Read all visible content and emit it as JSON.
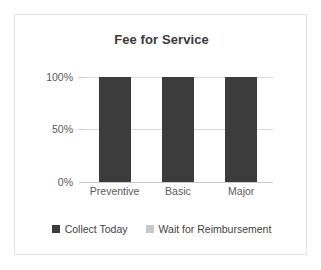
{
  "chart_data": {
    "type": "bar",
    "title": "Fee for Service",
    "xlabel": "",
    "ylabel": "",
    "categories": [
      "Preventive",
      "Basic",
      "Major"
    ],
    "series": [
      {
        "name": "Collect Today",
        "values": [
          100,
          100,
          100
        ],
        "color": "#3c3c3c"
      },
      {
        "name": "Wait for Reimbursement",
        "values": [
          0,
          0,
          0
        ],
        "color": "#c8c8c8"
      }
    ],
    "ylim": [
      0,
      100
    ],
    "yticks": [
      0,
      50,
      100
    ],
    "ytick_labels": [
      "0%",
      "50%",
      "100%"
    ],
    "grid": true,
    "legend_position": "bottom",
    "units": "percent"
  },
  "frame": {
    "border_color": "#e3e3e3",
    "background": "#ffffff"
  },
  "axis": {
    "labels": {
      "y100": "100%",
      "y50": "50%",
      "y0": "0%"
    },
    "categories": {
      "c0": "Preventive",
      "c1": "Basic",
      "c2": "Major"
    }
  },
  "legend": {
    "items": [
      {
        "label": "Collect Today",
        "color": "#3c3c3c"
      },
      {
        "label": "Wait for Reimbursement",
        "color": "#c8c8c8"
      }
    ]
  }
}
